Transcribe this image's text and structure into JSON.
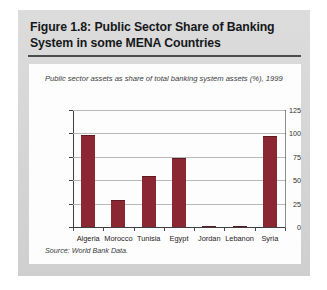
{
  "figure": {
    "title": "Figure 1.8: Public Sector Share of Banking System in some MENA Countries",
    "source": "Source: World Bank Data.",
    "panel_background": "#fdfdfd",
    "box_background": "#d8d8d8"
  },
  "chart_data": {
    "type": "bar",
    "title": "Public sector assets as share of total banking system assets (%), 1999",
    "xlabel": "",
    "ylabel": "",
    "ylim": [
      0,
      125
    ],
    "yticks": [
      0,
      25,
      50,
      75,
      100,
      125
    ],
    "ytick_labels": [
      "0",
      "25",
      "50",
      "75",
      "100",
      "125"
    ],
    "grid": true,
    "legend": false,
    "bar_color": "#8a2733",
    "categories": [
      "Algeria",
      "Morocco",
      "Tunisia",
      "Egypt",
      "Jordan",
      "Lebanon",
      "Syria"
    ],
    "values": [
      98,
      29,
      54,
      74,
      1.5,
      1.5,
      97
    ],
    "series": [
      {
        "name": "Public sector assets (% of total banking system assets), 1999",
        "values": [
          98,
          29,
          54,
          74,
          1.5,
          1.5,
          97
        ]
      }
    ]
  }
}
